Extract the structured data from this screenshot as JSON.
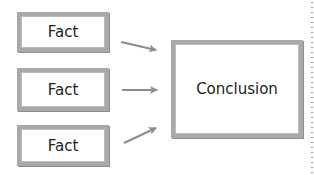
{
  "diagram": {
    "facts": [
      {
        "label": "Fact"
      },
      {
        "label": "Fact"
      },
      {
        "label": "Fact"
      }
    ],
    "conclusion": {
      "label": "Conclusion"
    },
    "arrows": [
      {
        "from": "fact-1",
        "to": "conclusion"
      },
      {
        "from": "fact-2",
        "to": "conclusion"
      },
      {
        "from": "fact-3",
        "to": "conclusion"
      }
    ],
    "colors": {
      "border": "#a9a9a9",
      "arrow": "#8c8c8c",
      "text": "#222222"
    }
  }
}
